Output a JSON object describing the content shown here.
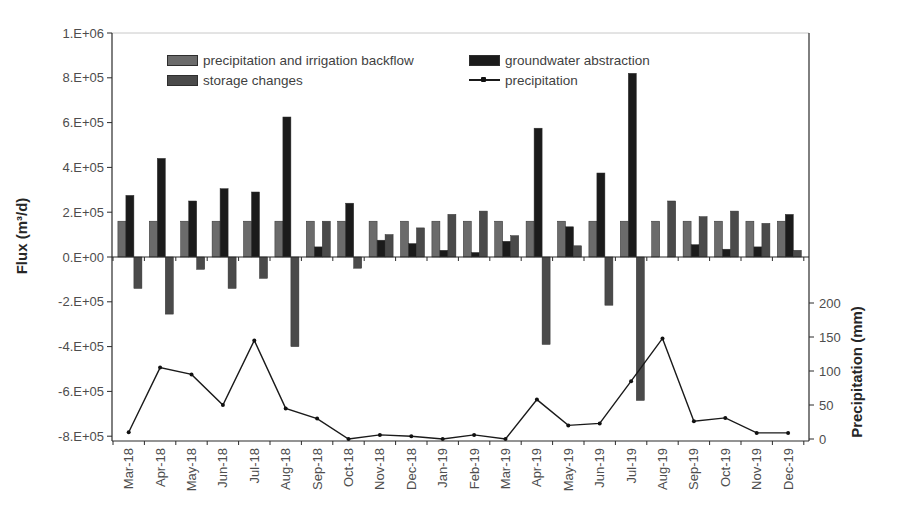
{
  "chart_data": {
    "type": "combo-bar-line",
    "title": "",
    "grid": "off",
    "categories": [
      "Mar-18",
      "Apr-18",
      "May-18",
      "Jun-18",
      "Jul-18",
      "Aug-18",
      "Sep-18",
      "Oct-18",
      "Nov-18",
      "Dec-18",
      "Jan-19",
      "Feb-19",
      "Mar-19",
      "Apr-19",
      "May-19",
      "Jun-19",
      "Jul-19",
      "Aug-19",
      "Sep-19",
      "Oct-19",
      "Nov-19",
      "Dec-19"
    ],
    "series": [
      {
        "name": "precipitation and irrigation backflow",
        "type": "bar",
        "axis": "left",
        "color": "#6b6b6b",
        "values": [
          160000,
          160000,
          160000,
          160000,
          160000,
          160000,
          160000,
          160000,
          160000,
          160000,
          160000,
          160000,
          160000,
          160000,
          160000,
          160000,
          160000,
          160000,
          160000,
          160000,
          160000,
          160000
        ]
      },
      {
        "name": "groundwater abstraction",
        "type": "bar",
        "axis": "left",
        "color": "#1b1b1b",
        "values": [
          275000,
          440000,
          250000,
          305000,
          290000,
          625000,
          45000,
          240000,
          75000,
          60000,
          30000,
          20000,
          70000,
          575000,
          135000,
          375000,
          820000,
          0,
          55000,
          35000,
          45000,
          190000
        ]
      },
      {
        "name": "storage changes",
        "type": "bar",
        "axis": "left",
        "color": "#4a4a4a",
        "values": [
          -140000,
          -255000,
          -55000,
          -140000,
          -95000,
          -400000,
          160000,
          -50000,
          100000,
          130000,
          190000,
          205000,
          95000,
          -390000,
          50000,
          -215000,
          -640000,
          250000,
          180000,
          205000,
          150000,
          30000
        ]
      },
      {
        "name": "precipitation",
        "type": "line",
        "axis": "right",
        "color": "#1a1a1a",
        "values": [
          10,
          105,
          95,
          50,
          145,
          45,
          30,
          0,
          6,
          4,
          0,
          6,
          0,
          58,
          20,
          23,
          85,
          148,
          26,
          31,
          9,
          9
        ]
      }
    ],
    "y_axis_left": {
      "title": "Flux (m³/d)",
      "min": -800000,
      "max": 1000000,
      "ticks": [
        {
          "label": "1.E+06",
          "value": 1000000
        },
        {
          "label": "8.E+05",
          "value": 800000
        },
        {
          "label": "6.E+05",
          "value": 600000
        },
        {
          "label": "4.E+05",
          "value": 400000
        },
        {
          "label": "2.E+05",
          "value": 200000
        },
        {
          "label": "0.E+00",
          "value": 0
        },
        {
          "label": "-2.E+05",
          "value": -200000
        },
        {
          "label": "-4.E+05",
          "value": -400000
        },
        {
          "label": "-6.E+05",
          "value": -600000
        },
        {
          "label": "-8.E+05",
          "value": -800000
        }
      ]
    },
    "y_axis_right": {
      "title": "Precipitation (mm)",
      "unit": "mm",
      "ticks": [
        {
          "label": "200",
          "value": 200
        },
        {
          "label": "150",
          "value": 150
        },
        {
          "label": "100",
          "value": 100
        },
        {
          "label": "50",
          "value": 50
        },
        {
          "label": "0",
          "value": 0
        }
      ]
    },
    "legend": {
      "position": "top",
      "order": [
        "precipitation and irrigation backflow",
        "storage changes",
        "groundwater abstraction",
        "precipitation"
      ]
    }
  }
}
